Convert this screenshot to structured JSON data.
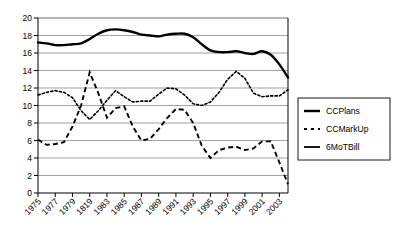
{
  "chart_data": {
    "type": "line",
    "title": "",
    "xlabel": "",
    "ylabel": "",
    "ylim": [
      0,
      20
    ],
    "ytick_step": 2,
    "yticks": [
      "0",
      "2",
      "4",
      "6",
      "8",
      "10",
      "12",
      "14",
      "16",
      "18",
      "20"
    ],
    "grid": "horizontal",
    "legend_position": "right",
    "xtick_labels": [
      "1975",
      "1977",
      "1979",
      "1819",
      "1983",
      "1985",
      "1987",
      "1989",
      "1991",
      "1993",
      "1995",
      "1997",
      "1999",
      "2001",
      "2003"
    ],
    "x": [
      1975,
      1976,
      1977,
      1978,
      1979,
      1980,
      1981,
      1982,
      1983,
      1984,
      1985,
      1986,
      1987,
      1988,
      1989,
      1990,
      1991,
      1992,
      1993,
      1994,
      1995,
      1996,
      1997,
      1998,
      1999,
      2000,
      2001,
      2002,
      2003,
      2004
    ],
    "series": [
      {
        "name": "CCPlans",
        "style": "solid-thick",
        "values": [
          17.2,
          17.1,
          16.9,
          16.9,
          17.0,
          17.1,
          17.6,
          18.2,
          18.6,
          18.7,
          18.6,
          18.4,
          18.1,
          18.0,
          17.9,
          18.1,
          18.2,
          18.2,
          17.8,
          17.0,
          16.3,
          16.1,
          16.1,
          16.2,
          16.0,
          15.9,
          16.2,
          15.8,
          14.7,
          13.2
        ]
      },
      {
        "name": "CCMarkUp",
        "style": "dotted",
        "values": [
          11.2,
          11.5,
          11.7,
          11.5,
          10.9,
          9.4,
          8.4,
          9.4,
          10.6,
          11.7,
          11.0,
          10.4,
          10.5,
          10.5,
          11.3,
          12.0,
          11.9,
          11.2,
          10.2,
          10.0,
          10.4,
          11.5,
          13.0,
          13.9,
          13.1,
          11.4,
          11.0,
          11.1,
          11.1,
          11.8
        ]
      },
      {
        "name": "6MoTBill",
        "style": "dashed",
        "values": [
          6.1,
          5.5,
          5.6,
          5.8,
          7.6,
          10.0,
          13.8,
          11.4,
          8.6,
          9.7,
          9.9,
          7.6,
          6.0,
          6.2,
          7.3,
          8.6,
          9.6,
          9.5,
          8.0,
          5.4,
          4.0,
          4.9,
          5.2,
          5.3,
          4.9,
          5.1,
          5.9,
          5.9,
          3.5,
          1.0
        ]
      }
    ],
    "legend": [
      {
        "label": "CCPlans",
        "style": "solid-thick"
      },
      {
        "label": "CCMarkUp",
        "style": "dotted"
      },
      {
        "label": "6MoTBill",
        "style": "solid-thin"
      }
    ]
  }
}
